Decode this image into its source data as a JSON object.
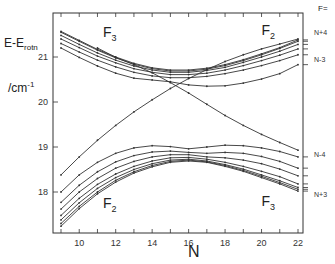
{
  "chart_data": {
    "type": "line",
    "title": "",
    "xlabel": "N",
    "ylabel": "E - E_rotn / cm^-1",
    "ylabel_line1": "E-E",
    "ylabel_sub": "rotn",
    "ylabel_line2": "/cm",
    "ylabel_sup": "-1",
    "xlim": [
      8.5,
      22.3
    ],
    "ylim": [
      1.71,
      2.17
    ],
    "x_ticks": [
      10,
      12,
      14,
      16,
      18,
      20,
      22
    ],
    "x_tick_labels": [
      "10",
      "12",
      "14",
      "16",
      "18",
      "20",
      "22"
    ],
    "y_ticks": [
      1.8,
      1.9,
      2.0,
      2.1
    ],
    "y_tick_labels": [
      "18",
      "19",
      "20",
      "21"
    ],
    "grid": false,
    "annotations": [
      {
        "text": "F",
        "sub": "3",
        "x": 11.3,
        "y": 2.145
      },
      {
        "text": "F",
        "sub": "2",
        "x": 20.0,
        "y": 2.15
      },
      {
        "text": "F",
        "sub": "2",
        "x": 11.3,
        "y": 1.765
      },
      {
        "text": "F",
        "sub": "3",
        "x": 20.0,
        "y": 1.77
      }
    ],
    "right_axis": {
      "title": "F=",
      "labels": [
        {
          "text": "N+4",
          "y": 2.155
        },
        {
          "text": "N-3",
          "y": 2.095
        },
        {
          "text": "N-4",
          "y": 1.885
        },
        {
          "text": "N+3",
          "y": 1.795
        }
      ]
    },
    "x": [
      9,
      10,
      11,
      12,
      13,
      14,
      15,
      16,
      17,
      18,
      19,
      20,
      21,
      22
    ],
    "series": [
      {
        "name": "upper-1",
        "values": [
          2.157,
          2.137,
          2.117,
          2.1,
          2.086,
          2.076,
          2.071,
          2.071,
          2.075,
          2.083,
          2.094,
          2.107,
          2.121,
          2.138
        ]
      },
      {
        "name": "upper-2",
        "values": [
          2.155,
          2.135,
          2.115,
          2.098,
          2.084,
          2.074,
          2.069,
          2.069,
          2.073,
          2.081,
          2.092,
          2.105,
          2.119,
          2.135
        ]
      },
      {
        "name": "upper-3",
        "values": [
          2.148,
          2.128,
          2.109,
          2.093,
          2.08,
          2.071,
          2.066,
          2.066,
          2.07,
          2.077,
          2.088,
          2.1,
          2.113,
          2.128
        ]
      },
      {
        "name": "upper-4",
        "values": [
          2.14,
          2.121,
          2.102,
          2.087,
          2.074,
          2.066,
          2.061,
          2.061,
          2.064,
          2.071,
          2.081,
          2.092,
          2.104,
          2.118
        ]
      },
      {
        "name": "upper-5",
        "values": [
          2.13,
          2.111,
          2.093,
          2.078,
          2.066,
          2.058,
          2.054,
          2.054,
          2.057,
          2.063,
          2.071,
          2.081,
          2.092,
          2.105
        ]
      },
      {
        "name": "upper-6",
        "values": [
          2.12,
          2.099,
          2.08,
          2.064,
          2.053,
          2.049,
          2.045,
          2.038,
          2.035,
          2.036,
          2.042,
          2.051,
          2.063,
          2.083
        ]
      },
      {
        "name": "crossing-rising",
        "values": [
          1.838,
          1.878,
          1.915,
          1.948,
          1.978,
          2.005,
          2.03,
          2.052,
          2.072,
          2.09,
          2.105,
          2.118,
          2.129,
          2.14
        ]
      },
      {
        "name": "crossing-falling",
        "values": [
          null,
          null,
          2.12,
          2.099,
          2.083,
          2.065,
          2.043,
          2.02,
          1.995,
          1.97,
          1.948,
          1.928,
          1.91,
          1.893
        ]
      },
      {
        "name": "lower-1",
        "values": [
          1.8,
          1.838,
          1.866,
          1.886,
          1.898,
          1.903,
          1.901,
          1.896,
          1.9,
          1.904,
          1.903,
          1.898,
          1.89,
          1.878
        ]
      },
      {
        "name": "lower-2",
        "values": [
          1.777,
          1.815,
          1.845,
          1.867,
          1.881,
          1.889,
          1.891,
          1.888,
          1.886,
          1.888,
          1.886,
          1.879,
          1.868,
          1.853
        ]
      },
      {
        "name": "lower-3",
        "values": [
          1.762,
          1.8,
          1.83,
          1.853,
          1.868,
          1.878,
          1.883,
          1.883,
          1.878,
          1.876,
          1.871,
          1.863,
          1.851,
          1.836
        ]
      },
      {
        "name": "lower-4",
        "values": [
          1.748,
          1.786,
          1.817,
          1.84,
          1.857,
          1.869,
          1.876,
          1.877,
          1.873,
          1.866,
          1.857,
          1.846,
          1.834,
          1.818
        ]
      },
      {
        "name": "lower-5",
        "values": [
          1.738,
          1.776,
          1.808,
          1.832,
          1.85,
          1.863,
          1.871,
          1.873,
          1.869,
          1.861,
          1.851,
          1.838,
          1.825,
          1.81
        ]
      },
      {
        "name": "lower-6",
        "values": [
          1.73,
          1.768,
          1.8,
          1.826,
          1.845,
          1.859,
          1.868,
          1.871,
          1.867,
          1.859,
          1.848,
          1.835,
          1.821,
          1.806
        ]
      },
      {
        "name": "lower-7",
        "values": [
          1.724,
          1.763,
          1.796,
          1.822,
          1.842,
          1.856,
          1.866,
          1.869,
          1.866,
          1.857,
          1.846,
          1.832,
          1.818,
          1.802
        ]
      }
    ]
  }
}
